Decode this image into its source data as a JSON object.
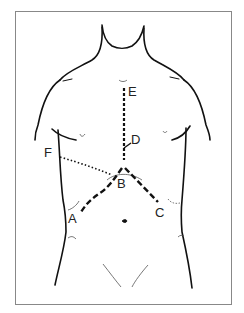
{
  "figure": {
    "labels": {
      "A": "A",
      "B": "B",
      "C": "C",
      "D": "D",
      "E": "E",
      "F": "F"
    },
    "colors": {
      "line": "#111111",
      "frame": "#777777",
      "background": "#ffffff"
    }
  }
}
